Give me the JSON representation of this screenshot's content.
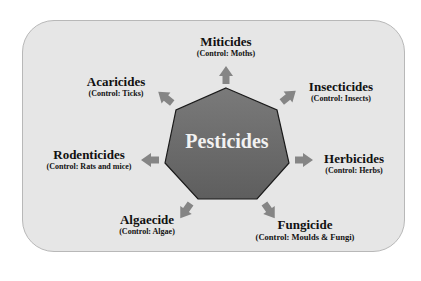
{
  "diagram": {
    "center_label": "Pesticides",
    "colors": {
      "panel": "#e6e6e6",
      "heptagon": "#6e6e6e",
      "arrow": "#8a8a8a",
      "text": "#111111"
    },
    "nodes": [
      {
        "name": "Miticides",
        "control": "(Control: Moths)"
      },
      {
        "name": "Insecticides",
        "control": "(Control: Insects)"
      },
      {
        "name": "Herbicides",
        "control": "(Control: Herbs)"
      },
      {
        "name": "Fungicide",
        "control": "(Control: Moulds & Fungi)"
      },
      {
        "name": "Algaecide",
        "control": "(Control: Algae)"
      },
      {
        "name": "Rodenticides",
        "control": "(Control: Rats and mice)"
      },
      {
        "name": "Acaricides",
        "control": "(Control: Ticks)"
      }
    ]
  }
}
